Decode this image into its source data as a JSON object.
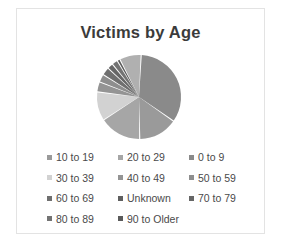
{
  "frame": {
    "border_color": "#e3e3e3",
    "background": "#ffffff"
  },
  "title": "Victims by Age",
  "legend": {
    "rows": [
      [
        {
          "label": "10 to 19",
          "color": "#9a9a9a"
        },
        {
          "label": "20 to 29",
          "color": "#a6a6a6"
        },
        {
          "label": "0 to 9",
          "color": "#8a8a8a"
        }
      ],
      [
        {
          "label": "30 to 39",
          "color": "#d2d2d2"
        },
        {
          "label": "40 to 49",
          "color": "#949494"
        },
        {
          "label": "50 to 59",
          "color": "#8e8e8e"
        }
      ],
      [
        {
          "label": "60 to 69",
          "color": "#6f6f6f"
        },
        {
          "label": "Unknown",
          "color": "#5f5f5f"
        },
        {
          "label": "70 to 79",
          "color": "#666666"
        }
      ],
      [
        {
          "label": "80 to 89",
          "color": "#737373"
        },
        {
          "label": "90 to Older",
          "color": "#5a5a5a"
        }
      ]
    ]
  },
  "chart_data": {
    "type": "pie",
    "title": "Victims by Age",
    "xlabel": "",
    "ylabel": "",
    "legend_position": "bottom",
    "grid": false,
    "start_angle_deg": 0,
    "direction": "clockwise",
    "categories": [
      "0 to 9",
      "10 to 19",
      "20 to 29",
      "30 to 39",
      "40 to 49",
      "50 to 59",
      "60 to 69",
      "70 to 79",
      "80 to 89",
      "90 to Older",
      "Unknown"
    ],
    "values": [
      34,
      15,
      16,
      11,
      4,
      3,
      3,
      2,
      2,
      1,
      9
    ],
    "unit": "percent",
    "slices": [
      {
        "label": "0 to 9",
        "value": 34,
        "color": "#8a8a8a",
        "start_deg": 3,
        "end_deg": 125
      },
      {
        "label": "10 to 19",
        "value": 15,
        "color": "#9a9a9a",
        "start_deg": 125,
        "end_deg": 179
      },
      {
        "label": "20 to 29",
        "value": 16,
        "color": "#a6a6a6",
        "start_deg": 179,
        "end_deg": 237
      },
      {
        "label": "30 to 39",
        "value": 11,
        "color": "#d2d2d2",
        "start_deg": 237,
        "end_deg": 277
      },
      {
        "label": "40 to 49",
        "value": 4,
        "color": "#949494",
        "start_deg": 277,
        "end_deg": 291
      },
      {
        "label": "50 to 59",
        "value": 3,
        "color": "#8e8e8e",
        "start_deg": 291,
        "end_deg": 302
      },
      {
        "label": "60 to 69",
        "value": 3,
        "color": "#6f6f6f",
        "start_deg": 302,
        "end_deg": 313
      },
      {
        "label": "70 to 79",
        "value": 2,
        "color": "#666666",
        "start_deg": 313,
        "end_deg": 321
      },
      {
        "label": "80 to 89",
        "value": 2,
        "color": "#737373",
        "start_deg": 321,
        "end_deg": 329
      },
      {
        "label": "90 to Older",
        "value": 1,
        "color": "#5a5a5a",
        "start_deg": 329,
        "end_deg": 333
      },
      {
        "label": "Unknown",
        "value": 9,
        "color": "#b0b0b0",
        "start_deg": 333,
        "end_deg": 363
      }
    ],
    "geometry": {
      "cx": 60,
      "cy": 44,
      "r": 42,
      "gap_deg": 1.6
    }
  }
}
